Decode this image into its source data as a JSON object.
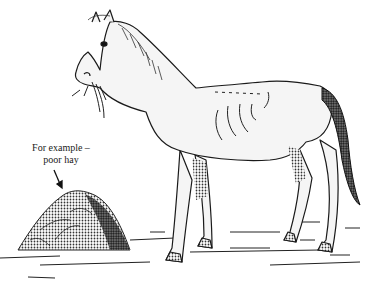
{
  "illustration": {
    "subject": "thin horse eating poor hay",
    "caption": {
      "line1": "For example –",
      "line2": "poor hay"
    },
    "colors": {
      "ink": "#1a1a1a",
      "background": "#ffffff",
      "horse_fill": "#f4f4f4",
      "hay_fill": "#4a4a4a"
    }
  }
}
